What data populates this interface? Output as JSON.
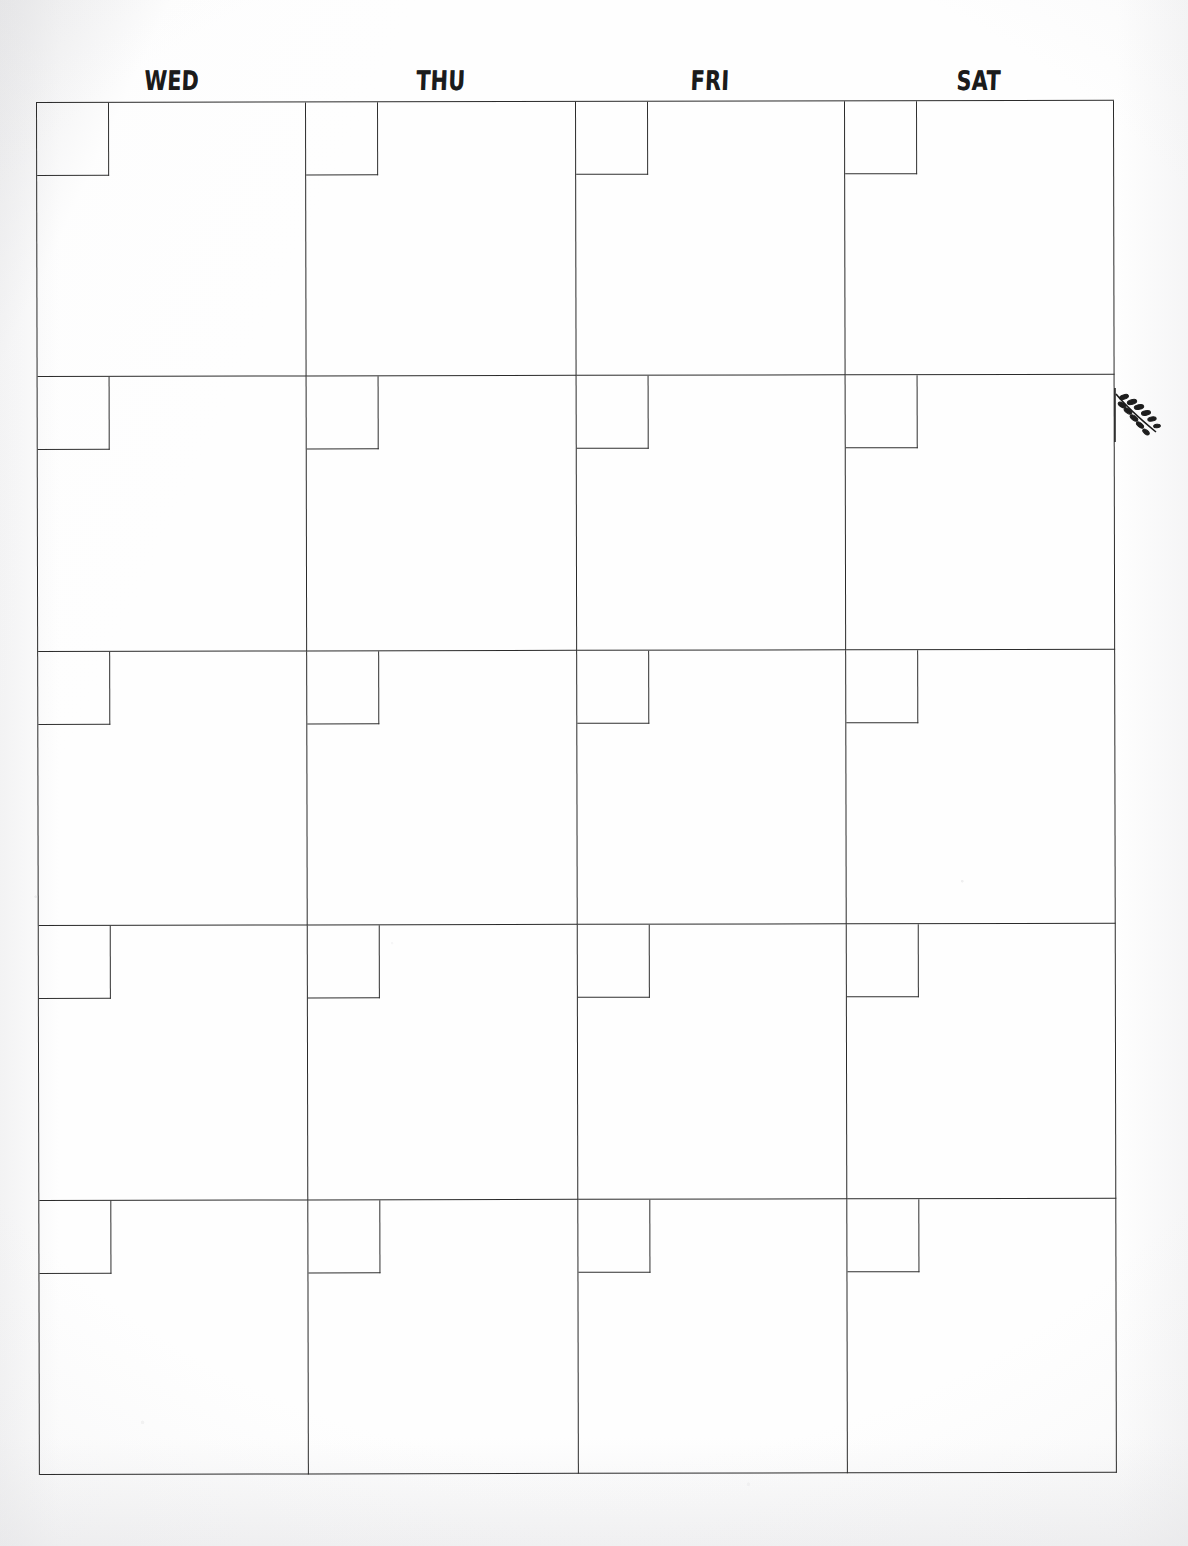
{
  "page": {
    "kind": "scanned-paper-calendar",
    "background_color": "#fdfdfd",
    "ink_color": "#2b2b2b"
  },
  "calendar": {
    "day_headers": [
      {
        "label": "WED"
      },
      {
        "label": "THU"
      },
      {
        "label": "FRI"
      },
      {
        "label": "SAT"
      }
    ],
    "column_count": 4,
    "row_count": 5,
    "cells": [
      {
        "date": "",
        "note": ""
      },
      {
        "date": "",
        "note": ""
      },
      {
        "date": "",
        "note": ""
      },
      {
        "date": "",
        "note": ""
      },
      {
        "date": "",
        "note": ""
      },
      {
        "date": "",
        "note": ""
      },
      {
        "date": "",
        "note": ""
      },
      {
        "date": "",
        "note": ""
      },
      {
        "date": "",
        "note": ""
      },
      {
        "date": "",
        "note": ""
      },
      {
        "date": "",
        "note": ""
      },
      {
        "date": "",
        "note": ""
      },
      {
        "date": "",
        "note": ""
      },
      {
        "date": "",
        "note": ""
      },
      {
        "date": "",
        "note": ""
      },
      {
        "date": "",
        "note": ""
      },
      {
        "date": "",
        "note": ""
      },
      {
        "date": "",
        "note": ""
      },
      {
        "date": "",
        "note": ""
      },
      {
        "date": "",
        "note": ""
      }
    ]
  },
  "decorations": {
    "leaf_branch": {
      "name": "leaf-branch-doodle",
      "color": "#1d1d1d"
    }
  }
}
